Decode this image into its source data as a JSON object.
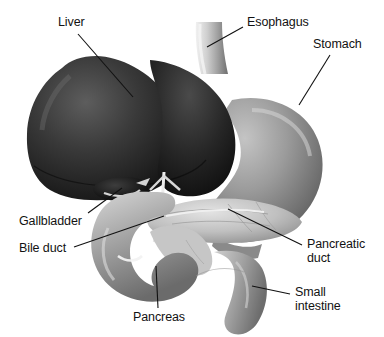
{
  "figure": {
    "background_color": "#ffffff",
    "text_color": "#121212",
    "width": 384,
    "height": 337
  },
  "labels": [
    {
      "id": "liver",
      "text": "Liver",
      "x": 58,
      "y": 16,
      "leader": {
        "x1": 78,
        "y1": 34,
        "x2": 133,
        "y2": 97
      }
    },
    {
      "id": "esophagus",
      "text": "Esophagus",
      "x": 247,
      "y": 16,
      "leader": {
        "x1": 243,
        "y1": 27,
        "x2": 207,
        "y2": 47
      }
    },
    {
      "id": "stomach",
      "text": "Stomach",
      "x": 313,
      "y": 38,
      "leader": {
        "x1": 330,
        "y1": 55,
        "x2": 299,
        "y2": 105
      }
    },
    {
      "id": "gallbladder",
      "text": "Gallbladder",
      "x": 19,
      "y": 215,
      "leader": {
        "x1": 88,
        "y1": 213,
        "x2": 122,
        "y2": 188
      }
    },
    {
      "id": "bile-duct",
      "text": "Bile duct",
      "x": 19,
      "y": 242,
      "leader": {
        "x1": 74,
        "y1": 247,
        "x2": 164,
        "y2": 216
      }
    },
    {
      "id": "pancreatic-duct",
      "text": "Pancreatic\nduct",
      "x": 307,
      "y": 238,
      "leader": {
        "x1": 302,
        "y1": 245,
        "x2": 228,
        "y2": 209
      }
    },
    {
      "id": "pancreas",
      "text": "Pancreas",
      "x": 133,
      "y": 311,
      "leader": {
        "x1": 158,
        "y1": 308,
        "x2": 156,
        "y2": 266
      }
    },
    {
      "id": "small-intestine",
      "text": "Small\nintestine",
      "x": 295,
      "y": 286,
      "leader": {
        "x1": 290,
        "y1": 294,
        "x2": 252,
        "y2": 286
      }
    }
  ],
  "organs": [
    {
      "id": "liver",
      "name": "Liver",
      "shade": "#2a2a2a"
    },
    {
      "id": "esophagus",
      "name": "Esophagus",
      "shade": "#c9c9c9"
    },
    {
      "id": "stomach",
      "name": "Stomach",
      "shade": "#8d8d8d"
    },
    {
      "id": "gallbladder",
      "name": "Gallbladder",
      "shade": "#1b1b1b"
    },
    {
      "id": "duodenum",
      "name": "Duodenum",
      "shade": "#9a9a9a"
    },
    {
      "id": "pancreas",
      "name": "Pancreas",
      "shade": "#bdbdbd"
    },
    {
      "id": "small-intestine",
      "name": "Small intestine",
      "shade": "#a8a8a8"
    },
    {
      "id": "bile-duct",
      "name": "Bile duct",
      "shade": "#d2d2d2"
    },
    {
      "id": "pancreatic-duct",
      "name": "Pancreatic duct",
      "shade": "#dcdcdc"
    }
  ]
}
